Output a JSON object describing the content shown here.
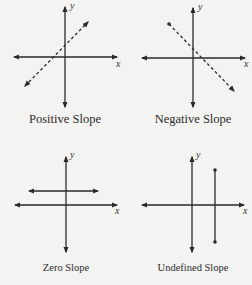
{
  "colors": {
    "background": "#f3f3f1",
    "line": "#2a2a2a"
  },
  "panels": [
    {
      "id": "positive",
      "caption": "Positive Slope",
      "x_axis_label": "x",
      "y_axis_label": "y",
      "line_style": "dashed",
      "line_type": "rising diagonal"
    },
    {
      "id": "negative",
      "caption": "Negative Slope",
      "x_axis_label": "x",
      "y_axis_label": "y",
      "line_style": "dashed",
      "line_type": "falling diagonal"
    },
    {
      "id": "zero",
      "caption": "Zero Slope",
      "x_axis_label": "x",
      "y_axis_label": "y",
      "line_style": "solid",
      "line_type": "horizontal"
    },
    {
      "id": "undefined",
      "caption": "Undefined Slope",
      "x_axis_label": "x",
      "y_axis_label": "y",
      "line_style": "solid",
      "line_type": "vertical"
    }
  ]
}
